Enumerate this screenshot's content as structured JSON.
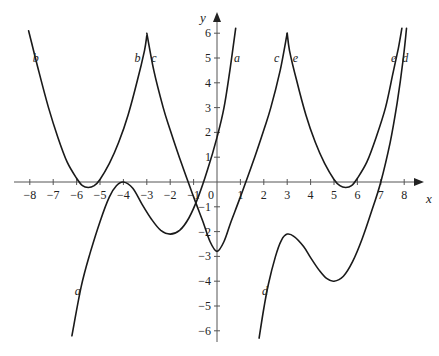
{
  "chart_data": {
    "type": "line",
    "title": "",
    "xlabel": "x",
    "ylabel": "y",
    "xlim": [
      -8,
      8
    ],
    "ylim": [
      -6,
      6
    ],
    "grid": false,
    "legend": "curves labelled inline",
    "x_ticks": [
      -8,
      -7,
      -6,
      -5,
      -4,
      -3,
      -2,
      -1,
      0,
      1,
      2,
      3,
      4,
      5,
      6,
      7,
      8
    ],
    "x_tick_labels": [
      "−8",
      "−7",
      "−6",
      "−5",
      "−4",
      "−3",
      "−2",
      "−1",
      "0",
      "1",
      "2",
      "3",
      "4",
      "5",
      "6",
      "7",
      "8"
    ],
    "y_ticks": [
      -6,
      -5,
      -4,
      -3,
      -2,
      -1,
      1,
      2,
      3,
      4,
      5,
      6
    ],
    "y_tick_labels": [
      "−6",
      "−5",
      "−4",
      "−3",
      "−2",
      "−1",
      "1",
      "2",
      "3",
      "4",
      "5",
      "6"
    ],
    "series": [
      {
        "name": "a",
        "points": [
          [
            -6.2,
            -6.2
          ],
          [
            -5.8,
            -4.2
          ],
          [
            -5.4,
            -2.8
          ],
          [
            -5.0,
            -1.6
          ],
          [
            -4.6,
            -0.6
          ],
          [
            -4.3,
            -0.15
          ],
          [
            -4.0,
            0.0
          ],
          [
            -3.6,
            -0.25
          ],
          [
            -3.2,
            -0.9
          ],
          [
            -2.8,
            -1.5
          ],
          [
            -2.4,
            -1.95
          ],
          [
            -2.0,
            -2.1
          ],
          [
            -1.6,
            -1.95
          ],
          [
            -1.2,
            -1.45
          ],
          [
            -0.8,
            -0.6
          ],
          [
            -0.4,
            0.5
          ],
          [
            0.0,
            1.8
          ],
          [
            0.3,
            3.0
          ],
          [
            0.55,
            4.5
          ],
          [
            0.8,
            6.2
          ]
        ],
        "label_pos": [
          -6.0,
          -4.4
        ]
      },
      {
        "name": "b",
        "points": [
          [
            -8.05,
            6.1
          ],
          [
            -7.6,
            4.4
          ],
          [
            -7.2,
            3.0
          ],
          [
            -6.8,
            1.8
          ],
          [
            -6.4,
            0.8
          ],
          [
            -6.0,
            0.15
          ],
          [
            -5.75,
            -0.15
          ],
          [
            -5.5,
            -0.22
          ],
          [
            -5.25,
            -0.15
          ],
          [
            -5.0,
            0.1
          ],
          [
            -4.6,
            0.75
          ],
          [
            -4.2,
            1.6
          ],
          [
            -3.8,
            2.7
          ],
          [
            -3.4,
            4.1
          ],
          [
            -3.1,
            5.3
          ],
          [
            -3.0,
            5.9
          ]
        ],
        "label_pos": [
          -7.7,
          5.0
        ]
      },
      {
        "name": "c",
        "points": [
          [
            -3.0,
            6.0
          ],
          [
            -2.7,
            4.5
          ],
          [
            -2.3,
            3.0
          ],
          [
            -2.0,
            2.1
          ],
          [
            -1.5,
            0.7
          ],
          [
            -1.0,
            -0.6
          ],
          [
            -0.6,
            -1.6
          ],
          [
            -0.3,
            -2.4
          ],
          [
            0.0,
            -2.8
          ],
          [
            0.3,
            -2.4
          ],
          [
            0.6,
            -1.6
          ],
          [
            1.0,
            -0.6
          ],
          [
            1.5,
            0.7
          ],
          [
            2.0,
            2.1
          ],
          [
            2.3,
            3.0
          ],
          [
            2.7,
            4.5
          ],
          [
            3.0,
            6.0
          ]
        ],
        "label_pos": [
          -2.7,
          5.0
        ]
      },
      {
        "name": "d",
        "points": [
          [
            1.8,
            -6.3
          ],
          [
            2.0,
            -5.1
          ],
          [
            2.2,
            -4.1
          ],
          [
            2.5,
            -3.0
          ],
          [
            2.75,
            -2.35
          ],
          [
            3.0,
            -2.1
          ],
          [
            3.3,
            -2.2
          ],
          [
            3.7,
            -2.6
          ],
          [
            4.0,
            -3.05
          ],
          [
            4.4,
            -3.6
          ],
          [
            4.7,
            -3.9
          ],
          [
            5.0,
            -4.0
          ],
          [
            5.4,
            -3.8
          ],
          [
            5.8,
            -3.2
          ],
          [
            6.2,
            -2.3
          ],
          [
            6.6,
            -1.2
          ],
          [
            7.0,
            0.0
          ],
          [
            7.4,
            1.6
          ],
          [
            7.7,
            3.2
          ],
          [
            7.95,
            4.9
          ],
          [
            8.1,
            6.2
          ]
        ],
        "label_pos": [
          2.1,
          -4.4
        ]
      },
      {
        "name": "e",
        "points": [
          [
            3.0,
            6.0
          ],
          [
            3.1,
            5.3
          ],
          [
            3.4,
            4.1
          ],
          [
            3.8,
            2.7
          ],
          [
            4.2,
            1.6
          ],
          [
            4.6,
            0.75
          ],
          [
            5.0,
            0.1
          ],
          [
            5.25,
            -0.15
          ],
          [
            5.5,
            -0.22
          ],
          [
            5.75,
            -0.15
          ],
          [
            6.0,
            0.15
          ],
          [
            6.4,
            0.8
          ],
          [
            6.8,
            1.8
          ],
          [
            7.2,
            3.0
          ],
          [
            7.5,
            4.3
          ],
          [
            7.75,
            5.4
          ],
          [
            7.9,
            6.2
          ]
        ],
        "label_pos": [
          3.3,
          5.0
        ]
      }
    ],
    "annotations": [
      {
        "text": "b",
        "x": -7.75,
        "y": 5.0
      },
      {
        "text": "b",
        "x": -3.4,
        "y": 5.0
      },
      {
        "text": "c",
        "x": -2.7,
        "y": 5.0
      },
      {
        "text": "a",
        "x": 0.85,
        "y": 5.0
      },
      {
        "text": "c",
        "x": 2.55,
        "y": 5.0
      },
      {
        "text": "e",
        "x": 3.35,
        "y": 5.0
      },
      {
        "text": "e",
        "x": 7.55,
        "y": 5.0
      },
      {
        "text": "d",
        "x": 8.05,
        "y": 5.0
      },
      {
        "text": "a",
        "x": -5.95,
        "y": -4.4
      },
      {
        "text": "d",
        "x": 2.05,
        "y": -4.4
      }
    ]
  },
  "axes": {
    "x_name": "x",
    "y_name": "y"
  },
  "style": {
    "curve_color": "#1a1a1a",
    "axis_color": "#555555",
    "background": "#ffffff"
  }
}
